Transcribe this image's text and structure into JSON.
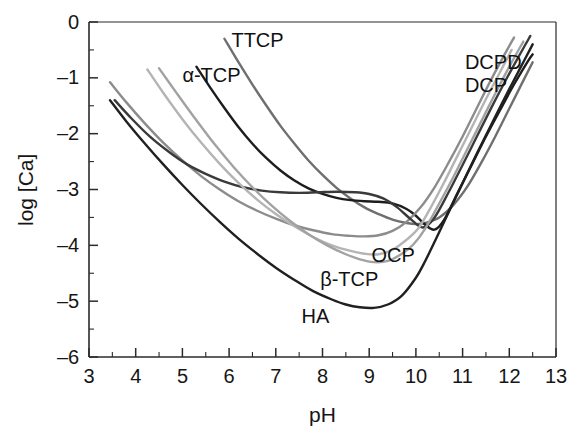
{
  "chart_data": {
    "type": "line",
    "title": "",
    "xlabel": "pH",
    "ylabel": "log [Ca]",
    "xlim": [
      3,
      13
    ],
    "ylim": [
      -6,
      0
    ],
    "grid": false,
    "legend_position": "inline-curve-labels",
    "x_ticks": [
      "3",
      "4",
      "5",
      "6",
      "7",
      "8",
      "9",
      "10",
      "11",
      "12",
      "13"
    ],
    "x_minor_tick_step": 0.5,
    "y_ticks": [
      "0",
      "–1",
      "–2",
      "–3",
      "–4",
      "–5",
      "–6"
    ],
    "y_minor_tick_step": 0.5,
    "series": [
      {
        "name": "TTCP",
        "label": "TTCP",
        "color": "#6f6f6f",
        "label_x": 6.05,
        "label_y": -0.33,
        "points": [
          [
            5.9,
            -0.3
          ],
          [
            6.2,
            -0.72
          ],
          [
            6.5,
            -1.12
          ],
          [
            6.8,
            -1.5
          ],
          [
            7.1,
            -1.86
          ],
          [
            7.4,
            -2.18
          ],
          [
            7.7,
            -2.48
          ],
          [
            8.0,
            -2.74
          ],
          [
            8.3,
            -2.97
          ],
          [
            8.6,
            -3.16
          ],
          [
            8.9,
            -3.32
          ],
          [
            9.2,
            -3.44
          ],
          [
            9.5,
            -3.54
          ],
          [
            9.8,
            -3.6
          ],
          [
            10.0,
            -3.62
          ],
          [
            10.2,
            -3.6
          ],
          [
            10.5,
            -3.5
          ],
          [
            10.8,
            -3.28
          ],
          [
            11.1,
            -2.95
          ],
          [
            11.4,
            -2.52
          ],
          [
            11.7,
            -2.05
          ],
          [
            12.0,
            -1.55
          ],
          [
            12.3,
            -1.05
          ],
          [
            12.5,
            -0.72
          ]
        ]
      },
      {
        "name": "alpha-TCP",
        "label": "α-TCP",
        "color": "#1d1d1d",
        "label_x": 5.0,
        "label_y": -0.95,
        "points": [
          [
            5.3,
            -0.8
          ],
          [
            5.6,
            -1.18
          ],
          [
            5.9,
            -1.54
          ],
          [
            6.2,
            -1.88
          ],
          [
            6.5,
            -2.18
          ],
          [
            6.8,
            -2.44
          ],
          [
            7.1,
            -2.66
          ],
          [
            7.4,
            -2.84
          ],
          [
            7.7,
            -2.98
          ],
          [
            8.0,
            -3.08
          ],
          [
            8.3,
            -3.15
          ],
          [
            8.6,
            -3.19
          ],
          [
            8.9,
            -3.21
          ],
          [
            9.2,
            -3.22
          ],
          [
            9.5,
            -3.25
          ],
          [
            9.8,
            -3.35
          ],
          [
            10.0,
            -3.47
          ],
          [
            10.2,
            -3.63
          ],
          [
            10.4,
            -3.72
          ],
          [
            10.6,
            -3.55
          ],
          [
            10.9,
            -3.05
          ],
          [
            11.2,
            -2.55
          ],
          [
            11.5,
            -2.05
          ],
          [
            11.8,
            -1.58
          ],
          [
            12.1,
            -1.12
          ],
          [
            12.4,
            -0.7
          ],
          [
            12.5,
            -0.58
          ]
        ]
      },
      {
        "name": "DCPD",
        "label": "DCPD",
        "color": "#8c8c8c",
        "label_x": 11.05,
        "label_y": -0.72,
        "points": [
          [
            3.45,
            -1.08
          ],
          [
            3.8,
            -1.44
          ],
          [
            4.2,
            -1.82
          ],
          [
            4.6,
            -2.17
          ],
          [
            5.0,
            -2.48
          ],
          [
            5.4,
            -2.76
          ],
          [
            5.8,
            -3.0
          ],
          [
            6.2,
            -3.21
          ],
          [
            6.6,
            -3.38
          ],
          [
            7.0,
            -3.52
          ],
          [
            7.4,
            -3.64
          ],
          [
            7.8,
            -3.73
          ],
          [
            8.2,
            -3.8
          ],
          [
            8.6,
            -3.83
          ],
          [
            8.9,
            -3.84
          ],
          [
            9.2,
            -3.82
          ],
          [
            9.5,
            -3.74
          ],
          [
            9.8,
            -3.58
          ],
          [
            10.1,
            -3.32
          ],
          [
            10.4,
            -2.96
          ],
          [
            10.7,
            -2.52
          ],
          [
            11.0,
            -2.05
          ],
          [
            11.3,
            -1.55
          ],
          [
            11.6,
            -1.05
          ],
          [
            11.9,
            -0.58
          ],
          [
            12.1,
            -0.28
          ]
        ]
      },
      {
        "name": "DCP",
        "label": "DCP",
        "color": "#3a3a3a",
        "label_x": 11.05,
        "label_y": -1.14,
        "points": [
          [
            3.55,
            -1.4
          ],
          [
            3.9,
            -1.72
          ],
          [
            4.3,
            -2.05
          ],
          [
            4.7,
            -2.32
          ],
          [
            5.1,
            -2.55
          ],
          [
            5.5,
            -2.72
          ],
          [
            5.9,
            -2.86
          ],
          [
            6.3,
            -2.96
          ],
          [
            6.7,
            -3.02
          ],
          [
            7.1,
            -3.05
          ],
          [
            7.5,
            -3.06
          ],
          [
            7.9,
            -3.05
          ],
          [
            8.3,
            -3.04
          ],
          [
            8.7,
            -3.05
          ],
          [
            9.0,
            -3.08
          ],
          [
            9.3,
            -3.16
          ],
          [
            9.6,
            -3.32
          ],
          [
            9.9,
            -3.54
          ],
          [
            10.15,
            -3.68
          ],
          [
            10.4,
            -3.5
          ],
          [
            10.7,
            -3.05
          ],
          [
            11.0,
            -2.56
          ],
          [
            11.3,
            -2.06
          ],
          [
            11.6,
            -1.56
          ],
          [
            11.9,
            -1.08
          ],
          [
            12.2,
            -0.62
          ],
          [
            12.45,
            -0.25
          ]
        ]
      },
      {
        "name": "OCP",
        "label": "OCP",
        "color": "#b4b4b4",
        "label_x": 9.05,
        "label_y": -4.18,
        "points": [
          [
            4.25,
            -0.85
          ],
          [
            4.6,
            -1.28
          ],
          [
            5.0,
            -1.74
          ],
          [
            5.4,
            -2.16
          ],
          [
            5.8,
            -2.54
          ],
          [
            6.2,
            -2.88
          ],
          [
            6.6,
            -3.18
          ],
          [
            7.0,
            -3.44
          ],
          [
            7.4,
            -3.66
          ],
          [
            7.8,
            -3.85
          ],
          [
            8.2,
            -4.0
          ],
          [
            8.6,
            -4.1
          ],
          [
            8.9,
            -4.15
          ],
          [
            9.2,
            -4.16
          ],
          [
            9.5,
            -4.08
          ],
          [
            9.8,
            -3.9
          ],
          [
            10.05,
            -3.7
          ],
          [
            10.3,
            -3.35
          ],
          [
            10.6,
            -2.88
          ],
          [
            10.9,
            -2.38
          ],
          [
            11.2,
            -1.88
          ],
          [
            11.5,
            -1.38
          ],
          [
            11.8,
            -0.9
          ],
          [
            12.05,
            -0.5
          ]
        ]
      },
      {
        "name": "beta-TCP",
        "label": "β-TCP",
        "color": "#a2a2a2",
        "label_x": 7.95,
        "label_y": -4.62,
        "points": [
          [
            4.5,
            -0.83
          ],
          [
            4.9,
            -1.3
          ],
          [
            5.3,
            -1.76
          ],
          [
            5.7,
            -2.2
          ],
          [
            6.1,
            -2.6
          ],
          [
            6.5,
            -2.96
          ],
          [
            6.9,
            -3.28
          ],
          [
            7.3,
            -3.56
          ],
          [
            7.7,
            -3.8
          ],
          [
            8.1,
            -4.0
          ],
          [
            8.5,
            -4.16
          ],
          [
            8.8,
            -4.25
          ],
          [
            9.1,
            -4.3
          ],
          [
            9.4,
            -4.28
          ],
          [
            9.7,
            -4.15
          ],
          [
            9.95,
            -3.98
          ],
          [
            10.2,
            -3.7
          ],
          [
            10.5,
            -3.25
          ],
          [
            10.8,
            -2.78
          ],
          [
            11.1,
            -2.28
          ],
          [
            11.4,
            -1.78
          ],
          [
            11.7,
            -1.28
          ],
          [
            12.0,
            -0.8
          ],
          [
            12.3,
            -0.35
          ]
        ]
      },
      {
        "name": "HA",
        "label": "HA",
        "color": "#202020",
        "label_x": 7.55,
        "label_y": -5.28,
        "points": [
          [
            3.45,
            -1.4
          ],
          [
            3.8,
            -1.78
          ],
          [
            4.2,
            -2.18
          ],
          [
            4.6,
            -2.56
          ],
          [
            5.0,
            -2.92
          ],
          [
            5.4,
            -3.26
          ],
          [
            5.8,
            -3.58
          ],
          [
            6.2,
            -3.88
          ],
          [
            6.6,
            -4.15
          ],
          [
            7.0,
            -4.4
          ],
          [
            7.4,
            -4.62
          ],
          [
            7.8,
            -4.82
          ],
          [
            8.2,
            -4.97
          ],
          [
            8.5,
            -5.06
          ],
          [
            8.8,
            -5.11
          ],
          [
            9.1,
            -5.12
          ],
          [
            9.4,
            -5.06
          ],
          [
            9.7,
            -4.9
          ],
          [
            10.0,
            -4.58
          ],
          [
            10.2,
            -4.28
          ],
          [
            10.45,
            -3.85
          ],
          [
            10.75,
            -3.32
          ],
          [
            11.05,
            -2.8
          ],
          [
            11.35,
            -2.28
          ],
          [
            11.65,
            -1.78
          ],
          [
            11.95,
            -1.28
          ],
          [
            12.25,
            -0.8
          ],
          [
            12.5,
            -0.4
          ]
        ]
      }
    ]
  },
  "axes": {
    "x_title": "pH",
    "y_title": "log [Ca]"
  }
}
